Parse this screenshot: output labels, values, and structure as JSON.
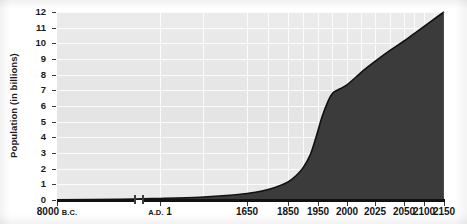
{
  "chart_data": {
    "type": "area",
    "title": "",
    "xlabel": "",
    "ylabel": "Population (in billions)",
    "ylim": [
      0,
      12
    ],
    "grid": true,
    "legend": false,
    "y_ticks": [
      12,
      11,
      10,
      9,
      8,
      7,
      6,
      5,
      4,
      3,
      2,
      1,
      0
    ],
    "x_tick_labels": [
      "8000 B.C.",
      "A.D. 1",
      "1650",
      "1850",
      "1950",
      "2000",
      "2025",
      "2050",
      "2100",
      "2150"
    ],
    "x_axis_broken": true,
    "series": [
      {
        "name": "World population",
        "x": [
          "8000 B.C.",
          "A.D. 1",
          "1650",
          "1850",
          "1950",
          "2000",
          "2025",
          "2050",
          "2100",
          "2150"
        ],
        "values": [
          0.005,
          0.2,
          0.5,
          1.2,
          2.5,
          6.1,
          8.0,
          9.4,
          11.0,
          12.0
        ]
      }
    ],
    "colors": {
      "area_fill": "#3b3b3b",
      "plot_background": "#e7e7e7",
      "gridline": "#fbfbfb",
      "axis": "#111111",
      "text": "#151515"
    }
  },
  "axis": {
    "y_title": "Population (in billions)",
    "y_labels": [
      "12",
      "11",
      "10",
      "9",
      "8",
      "7",
      "6",
      "5",
      "4",
      "3",
      "2",
      "1",
      "0"
    ],
    "x_labels": [
      {
        "main": "8000",
        "era": "B.C.",
        "era_position": "after"
      },
      {
        "main": "1",
        "era": "A.D.",
        "era_position": "before"
      },
      {
        "main": "1650",
        "era": "",
        "era_position": ""
      },
      {
        "main": "1850",
        "era": "",
        "era_position": ""
      },
      {
        "main": "1950",
        "era": "",
        "era_position": ""
      },
      {
        "main": "2000",
        "era": "",
        "era_position": ""
      },
      {
        "main": "2025",
        "era": "",
        "era_position": ""
      },
      {
        "main": "2050",
        "era": "",
        "era_position": ""
      },
      {
        "main": "2100",
        "era": "",
        "era_position": ""
      },
      {
        "main": "2150",
        "era": "",
        "era_position": ""
      }
    ]
  }
}
